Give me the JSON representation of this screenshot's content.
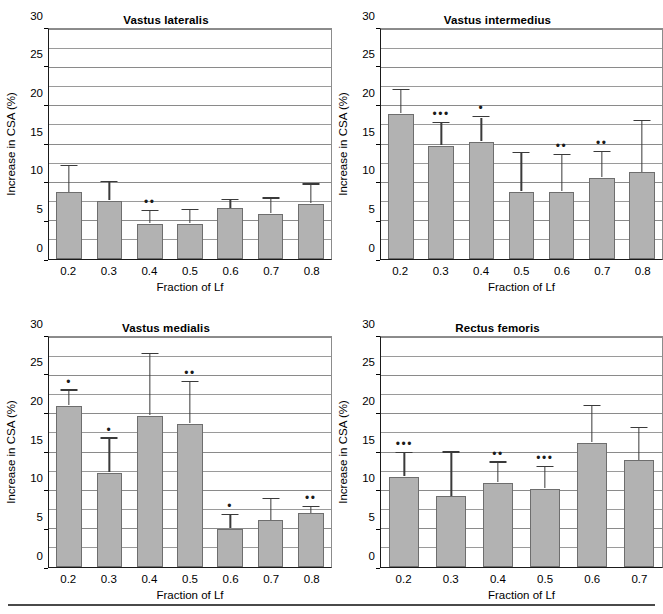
{
  "figure": {
    "axis_label_y": "Increase in CSA (%)",
    "axis_label_x": "Fraction of Lf",
    "ylim": [
      0,
      30
    ],
    "y_ticks": [
      0,
      5,
      10,
      15,
      20,
      25,
      30
    ],
    "gridline_step": 2.5,
    "bar_color": "#b2b2b2",
    "bar_border_color": "#6e6e6e",
    "error_color": "#3a3a3a",
    "grid_color": "#8a8a8a",
    "axis_color": "#1a1a1a"
  },
  "chart_data": [
    {
      "type": "bar",
      "title": "Vastus lateralis",
      "xlabel": "Fraction of Lf",
      "ylabel": "Increase in CSA (%)",
      "ylim": [
        0,
        30
      ],
      "yticks": [
        0,
        5,
        10,
        15,
        20,
        25,
        30
      ],
      "grid": true,
      "legend": "none",
      "categories": [
        "0.2",
        "0.3",
        "0.4",
        "0.5",
        "0.6",
        "0.7",
        "0.8"
      ],
      "values": [
        8.7,
        7.6,
        4.6,
        4.6,
        6.6,
        5.9,
        7.2
      ],
      "errors": [
        3.3,
        2.3,
        1.6,
        1.7,
        1.0,
        1.9,
        2.4
      ],
      "significance": [
        "",
        "",
        "••",
        "",
        "",
        "",
        ""
      ]
    },
    {
      "type": "bar",
      "title": "Vastus intermedius",
      "xlabel": "Fraction of Lf",
      "ylabel": "Increase in CSA (%)",
      "ylim": [
        0,
        30
      ],
      "yticks": [
        0,
        5,
        10,
        15,
        20,
        25,
        30
      ],
      "grid": true,
      "legend": "none",
      "categories": [
        "0.2",
        "0.3",
        "0.4",
        "0.5",
        "0.6",
        "0.7",
        "0.8"
      ],
      "values": [
        18.9,
        14.8,
        15.2,
        8.8,
        8.8,
        10.6,
        11.3
      ],
      "errors": [
        2.9,
        2.8,
        3.1,
        4.9,
        4.6,
        3.2,
        6.5
      ],
      "significance": [
        "",
        "•••",
        "•",
        "",
        "••",
        "••",
        ""
      ]
    },
    {
      "type": "bar",
      "title": "Vastus medialis",
      "xlabel": "Fraction of Lf",
      "ylabel": "Increase in CSA (%)",
      "ylim": [
        0,
        30
      ],
      "yticks": [
        0,
        5,
        10,
        15,
        20,
        25,
        30
      ],
      "grid": true,
      "legend": "none",
      "categories": [
        "0.2",
        "0.3",
        "0.4",
        "0.5",
        "0.6",
        "0.7",
        "0.8"
      ],
      "values": [
        21.0,
        12.3,
        19.7,
        18.6,
        5.0,
        6.1,
        7.0
      ],
      "errors": [
        1.8,
        4.3,
        7.8,
        5.3,
        1.7,
        2.7,
        0.7
      ],
      "significance": [
        "•",
        "•",
        "",
        "••",
        "•",
        "",
        "••"
      ]
    },
    {
      "type": "bar",
      "title": "Rectus femoris",
      "xlabel": "Fraction of Lf",
      "ylabel": "Increase in CSA (%)",
      "ylim": [
        0,
        30
      ],
      "yticks": [
        0,
        5,
        10,
        15,
        20,
        25,
        30
      ],
      "grid": true,
      "legend": "none",
      "categories": [
        "0.2",
        "0.3",
        "0.4",
        "0.5",
        "0.6",
        "0.7"
      ],
      "values": [
        11.8,
        9.2,
        11.0,
        10.2,
        16.2,
        13.9
      ],
      "errors": [
        2.9,
        5.6,
        2.5,
        2.7,
        4.6,
        4.1
      ],
      "significance": [
        "•••",
        "",
        "••",
        "•••",
        "",
        ""
      ]
    }
  ]
}
